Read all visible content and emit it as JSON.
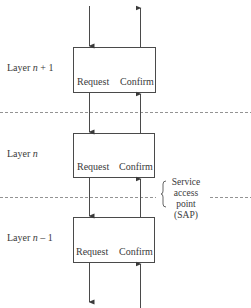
{
  "diagram": {
    "type": "layered-protocol-service-primitives",
    "layers": [
      {
        "label_prefix": "Layer ",
        "var": "n",
        "suffix": " + 1",
        "left_label": "Request",
        "right_label": "Confirm"
      },
      {
        "label_prefix": "Layer ",
        "var": "n",
        "suffix": "",
        "left_label": "Request",
        "right_label": "Confirm"
      },
      {
        "label_prefix": "Layer ",
        "var": "n",
        "suffix": " – 1",
        "left_label": "Request",
        "right_label": "Confirm"
      }
    ],
    "sap": {
      "line1": "Service",
      "line2": "access",
      "line3": "point",
      "line4": "(SAP)"
    },
    "colors": {
      "line": "#4a4a4a",
      "dash": "#777777",
      "text": "#3a3a3a"
    }
  }
}
